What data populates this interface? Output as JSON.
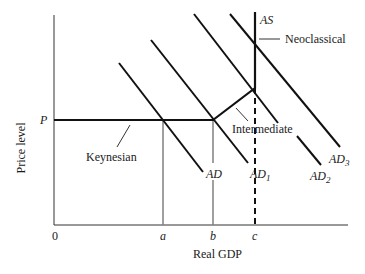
{
  "diagram": {
    "axes": {
      "x_label": "Real GDP",
      "y_label": "Price level",
      "origin": "0",
      "x_ticks": [
        "a",
        "b",
        "c"
      ],
      "y_ticks": [
        "P"
      ]
    },
    "curves": {
      "as": "AS",
      "ad": "AD",
      "ad1": "AD",
      "ad1_sub": "1",
      "ad2": "AD",
      "ad2_sub": "2",
      "ad3": "AD",
      "ad3_sub": "3"
    },
    "regions": {
      "keynesian": "Keynesian",
      "intermediate": "Intermediate",
      "neoclassical": "Neoclassical"
    },
    "colors": {
      "line": "#111111",
      "guide": "#808080"
    }
  }
}
